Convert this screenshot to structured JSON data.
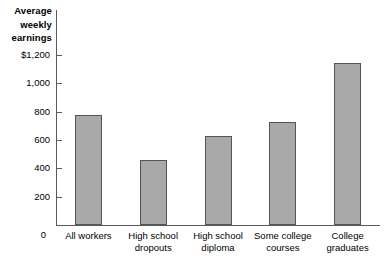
{
  "chart_data": {
    "type": "bar",
    "title": "Average weekly earnings",
    "xlabel": "",
    "ylabel": "Average weekly earnings",
    "categories": [
      "All workers",
      "High school dropouts",
      "High school diploma",
      "Some college courses",
      "College graduates"
    ],
    "category_lines": [
      [
        "All workers"
      ],
      [
        "High school",
        "dropouts"
      ],
      [
        "High school",
        "diploma"
      ],
      [
        "Some college",
        "courses"
      ],
      [
        "College",
        "graduates"
      ]
    ],
    "values": [
      775,
      460,
      630,
      725,
      1145
    ],
    "ylim": [
      0,
      1200
    ],
    "ytick_values": [
      0,
      200,
      400,
      600,
      800,
      1000,
      1200
    ],
    "ytick_labels": [
      "0",
      "200",
      "400",
      "600",
      "800",
      "1,000",
      "$1,200"
    ],
    "grid": false,
    "legend": null,
    "bar_color": "#a9a9a9",
    "bar_border_color": "#555555",
    "axis_color": "#5a5a5a"
  },
  "axis_title_lines": [
    "Average",
    "weekly",
    "earnings"
  ]
}
